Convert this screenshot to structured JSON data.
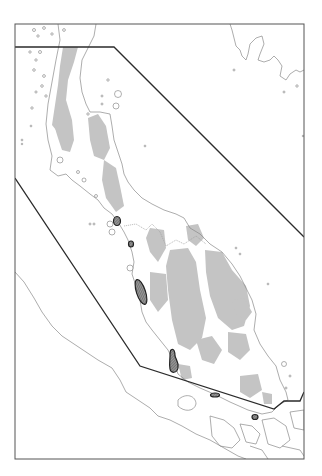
{
  "map": {
    "subject": "Malay Peninsula",
    "colors": {
      "background": "#ffffff",
      "frame": "#555555",
      "coastline": "#8a8a8a",
      "highland_shading": "#c4c4c4",
      "study_boundary": "#2b2b2b",
      "site_outline": "#222222",
      "site_fill": "#7d7d7d"
    },
    "frame": {
      "x": 15,
      "y": 24,
      "width": 289,
      "height": 435
    },
    "study_boundary_polygon": [
      [
        15,
        47
      ],
      [
        114,
        47
      ],
      [
        304,
        237
      ],
      [
        304,
        398
      ],
      [
        300,
        401
      ],
      [
        284,
        401
      ],
      [
        274,
        409
      ],
      [
        140,
        366
      ],
      [
        15,
        178
      ]
    ],
    "hatched_sites": [
      {
        "name": "site-1",
        "cx": 117,
        "cy": 221,
        "rx": 4,
        "ry": 5
      },
      {
        "name": "site-2",
        "cx": 131,
        "cy": 244,
        "rx": 3,
        "ry": 3.5
      },
      {
        "name": "site-3",
        "cx": 140,
        "cy": 292,
        "rx": 5,
        "ry": 14,
        "rotate": -20
      },
      {
        "name": "site-4",
        "cx": 173,
        "cy": 362,
        "rx": 5,
        "ry": 10
      },
      {
        "name": "site-5",
        "cx": 215,
        "cy": 395,
        "rx": 5,
        "ry": 2.5
      },
      {
        "name": "site-6",
        "cx": 255,
        "cy": 417,
        "rx": 3.5,
        "ry": 3
      }
    ],
    "labels": []
  }
}
